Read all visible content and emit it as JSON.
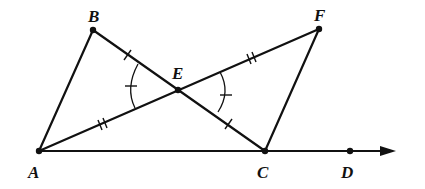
{
  "diagram": {
    "type": "geometry",
    "points": [
      {
        "name": "A",
        "x": 39,
        "y": 151
      },
      {
        "name": "B",
        "x": 93,
        "y": 30
      },
      {
        "name": "E",
        "x": 178,
        "y": 90
      },
      {
        "name": "F",
        "x": 319,
        "y": 29
      },
      {
        "name": "C",
        "x": 265,
        "y": 151
      },
      {
        "name": "D",
        "x": 350,
        "y": 151
      }
    ],
    "labels": {
      "A": "A",
      "B": "B",
      "C": "C",
      "D": "D",
      "E": "E",
      "F": "F"
    },
    "segments": [
      "AB",
      "BC",
      "AF",
      "FC",
      "AD (ray)"
    ],
    "marks": {
      "single_tick": [
        "BE",
        "EC"
      ],
      "double_tick": [
        "AE",
        "EF"
      ],
      "angle_marks": [
        "angle BEA",
        "angle FEC"
      ]
    },
    "colors": {
      "stroke": "#111111",
      "background": "#ffffff"
    }
  }
}
